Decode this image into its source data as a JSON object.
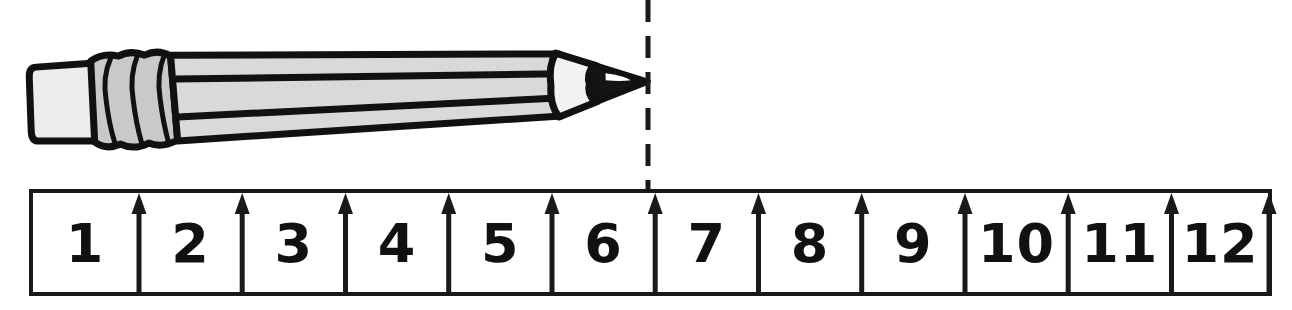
{
  "figure": {
    "type": "measurement-diagram",
    "width": 1292,
    "height": 310,
    "background_color": "#ffffff"
  },
  "ruler": {
    "label": "ruler",
    "unit_count": 12,
    "numbers": [
      "1",
      "2",
      "3",
      "4",
      "5",
      "6",
      "7",
      "8",
      "9",
      "10",
      "11",
      "12"
    ],
    "left_px": 31,
    "right_px": 1270,
    "top_px": 191,
    "bottom_px": 294,
    "unit_width_px": 103.25,
    "border_color": "#1a1a1a",
    "fill_color": "#ffffff",
    "number_color": "#111111",
    "tick_color": "#1a1a1a",
    "tick_count": 12,
    "tick_style": "up-arrow"
  },
  "pencil": {
    "label": "pencil",
    "tip_x_px": 648,
    "measured_length_units": 6,
    "body_color": "#d9d9d9",
    "outline_color": "#111111",
    "eraser_color": "#ececec",
    "ferrule_color": "#c9c9c9",
    "wood_color": "#f0f0f0",
    "graphite_color": "#141414",
    "stripe_color": "#111111",
    "stripe_count": 2,
    "tilt_degrees": -2.2
  },
  "dashed_line": {
    "label": "alignment-line",
    "x_px": 648,
    "y_start_px": 0,
    "y_end_px": 191,
    "color": "#1a1a1a",
    "dash_px": 22,
    "gap_px": 14,
    "width_px": 5
  }
}
